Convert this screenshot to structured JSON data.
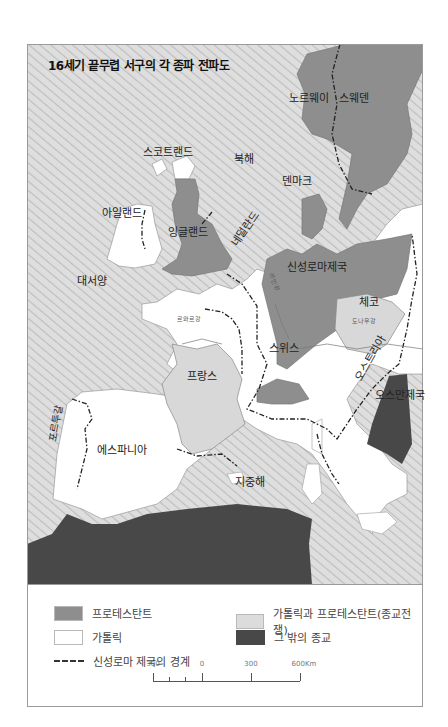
{
  "title": "16세기 끝무렵 서구의 각 종파 전파도",
  "colors": {
    "protestant": "#8e8e8e",
    "catholic": "#ffffff",
    "mixed": "#d8d8d8",
    "other": "#484848",
    "sea": "#d9d9d9",
    "sea_hatch": "#c4c4c4",
    "border": "#222222"
  },
  "regions": {
    "norway": "노르웨이",
    "sweden": "스웨덴",
    "scotland": "스코트랜드",
    "north_sea": "북해",
    "denmark": "덴마크",
    "ireland": "아일랜드",
    "england": "잉글랜드",
    "netherlands": "네덜란드",
    "atlantic": "대서양",
    "hre": "신성로마제국",
    "rhine": "라인강",
    "czech": "체코",
    "danube": "도나우강",
    "loire": "르와르강",
    "switzerland": "스위스",
    "austria": "오스트리아",
    "france": "프랑스",
    "ottoman": "오스만제국",
    "portugal": "포르투갈",
    "spain": "에스파니아",
    "mediterranean": "지중해"
  },
  "legend": {
    "items": [
      {
        "label": "프로테스탄트",
        "swatch": "protestant"
      },
      {
        "label": "가톨릭과 프로테스탄트(종교전쟁)",
        "swatch": "mixed"
      },
      {
        "label": "가톨릭",
        "swatch": "catholic"
      },
      {
        "label": "그 밖의 종교",
        "swatch": "other"
      }
    ],
    "boundary_label": "신성로마 제국의 경계"
  },
  "scale": {
    "ticks": [
      "300",
      "0",
      "300",
      "600Km"
    ]
  }
}
